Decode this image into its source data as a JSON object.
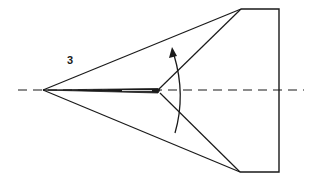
{
  "diagram": {
    "type": "paper-folding-instruction",
    "step_number": "3",
    "colors": {
      "stroke": "#1a1a1a",
      "background": "#ffffff"
    },
    "elements": {
      "centerline": "dashed horizontal fold line",
      "outer_triangle": "folded wing edges meeting at nose point",
      "inner_fold": "inner flap edges meeting at center crease",
      "tail_rectangle": "unfolded rear section of paper",
      "fold_arrow": "curved arrow indicating fold direction upward"
    }
  }
}
